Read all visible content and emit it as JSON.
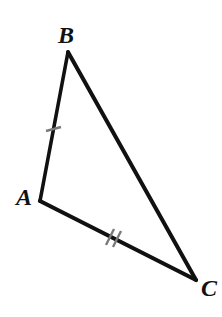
{
  "figure": {
    "kind": "geometry-diagram",
    "shape": "triangle",
    "canvas": {
      "width": 222,
      "height": 317,
      "background": "#ffffff"
    },
    "stroke_color": "#111111",
    "tick_color": "#7a7a7a",
    "label_color": "#111111"
  },
  "vertices": [
    {
      "id": "A",
      "label": "A",
      "x": 40,
      "y": 201,
      "label_x": 16,
      "label_y": 205
    },
    {
      "id": "B",
      "label": "B",
      "x": 68,
      "y": 52,
      "label_x": 58,
      "label_y": 43
    },
    {
      "id": "C",
      "label": "C",
      "x": 196,
      "y": 280,
      "label_x": 201,
      "label_y": 296
    }
  ],
  "sides": [
    {
      "id": "AB",
      "from": "A",
      "to": "B",
      "x1": 40,
      "y1": 201,
      "x2": 68,
      "y2": 52,
      "stroke_width": 3.6,
      "ticks": 1
    },
    {
      "id": "BC",
      "from": "B",
      "to": "C",
      "x1": 68,
      "y1": 52,
      "x2": 196,
      "y2": 280,
      "stroke_width": 4.0,
      "ticks": 0
    },
    {
      "id": "AC",
      "from": "A",
      "to": "C",
      "x1": 40,
      "y1": 201,
      "x2": 196,
      "y2": 280,
      "stroke_width": 4.2,
      "ticks": 2
    }
  ],
  "tick_marks": [
    {
      "id": "tick-ab-1",
      "on_side": "AB",
      "count": 1,
      "center_x": 53,
      "center_y": 129,
      "x1": 46,
      "y1": 131,
      "x2": 61,
      "y2": 127,
      "stroke_width": 2.4
    },
    {
      "id": "tick-ac-1",
      "on_side": "AC",
      "count": 2,
      "center_x": 110,
      "center_y": 237,
      "x1": 106,
      "y1": 245,
      "x2": 114,
      "y2": 229,
      "stroke_width": 2.4
    },
    {
      "id": "tick-ac-2",
      "on_side": "AC",
      "count": 2,
      "center_x": 117,
      "center_y": 239,
      "x1": 113,
      "y1": 247,
      "x2": 121,
      "y2": 231,
      "stroke_width": 2.4
    }
  ]
}
